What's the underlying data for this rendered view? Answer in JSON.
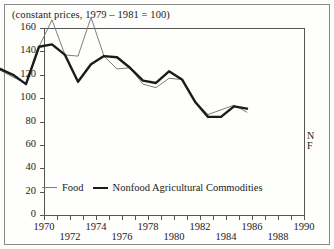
{
  "figure": {
    "caption": "(constant prices, 1979 – 1981 = 100)",
    "end_label_nonfood": "N",
    "end_label_food": "F"
  },
  "legend": {
    "food_label": "Food",
    "nonfood_label": "Nonfood Agricultural Commodities",
    "food_color": "#7d7d79",
    "nonfood_color": "#1b1b1b"
  },
  "chart_data": {
    "type": "line",
    "title": "(constant prices, 1979 – 1981 = 100)",
    "xlabel": "",
    "ylabel": "",
    "xlim": [
      1970,
      1990
    ],
    "ylim": [
      0,
      160
    ],
    "yticks": [
      0,
      20,
      40,
      60,
      80,
      100,
      120,
      140,
      160
    ],
    "ytick_labels": [
      "0",
      "20",
      "40",
      "60",
      "80",
      "100",
      "120",
      "140",
      "160"
    ],
    "xticks": [
      1970,
      1971,
      1972,
      1973,
      1974,
      1975,
      1976,
      1977,
      1978,
      1979,
      1980,
      1981,
      1982,
      1983,
      1984,
      1985,
      1986,
      1987,
      1988,
      1989,
      1990
    ],
    "xtick_labels_upper": [
      "1970",
      "1974",
      "1978",
      "1982",
      "1986",
      "1990"
    ],
    "xtick_labels_lower": [
      "1972",
      "1976",
      "1980",
      "1984",
      "1988"
    ],
    "grid": false,
    "legend_position": "bottom-left",
    "x": [
      1970,
      1971,
      1972,
      1973,
      1974,
      1975,
      1976,
      1977,
      1978,
      1979,
      1980,
      1981,
      1982,
      1983,
      1984,
      1985,
      1986,
      1987,
      1988,
      1989
    ],
    "series": [
      {
        "name": "Food",
        "color": "#7d7d79",
        "values": [
          100,
          94,
          89,
          120,
          143,
          113,
          112,
          145,
          112,
          101,
          102,
          88,
          85,
          93,
          92,
          73,
          62,
          66,
          70,
          64
        ]
      },
      {
        "name": "Nonfood Agricultural Commodities",
        "color": "#1b1b1b",
        "values": [
          101,
          96,
          88,
          120,
          122,
          113,
          90,
          105,
          112,
          111,
          102,
          91,
          89,
          99,
          92,
          73,
          60,
          60,
          69,
          67
        ]
      }
    ]
  }
}
